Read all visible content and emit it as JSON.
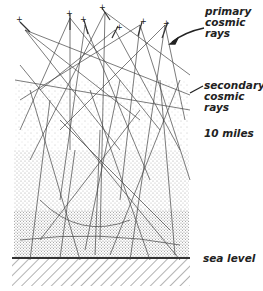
{
  "diagram": {
    "labels": {
      "primary": [
        "primary",
        "cosmic",
        "rays"
      ],
      "secondary": [
        "secondary",
        "cosmic",
        "rays"
      ],
      "altitude": "10 miles",
      "ground": "sea level"
    },
    "colors": {
      "ink": "#333333",
      "background": "#ffffff",
      "ground_hatch": "#555555"
    }
  }
}
